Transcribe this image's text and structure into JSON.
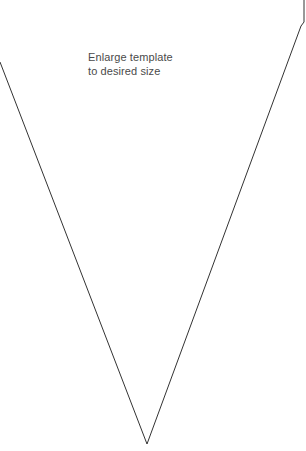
{
  "template": {
    "instruction_lines": [
      "Enlarge template",
      "to desired size"
    ],
    "shape": "pennant-triangle",
    "stroke_color": "#333333",
    "background_color": "#ffffff"
  }
}
